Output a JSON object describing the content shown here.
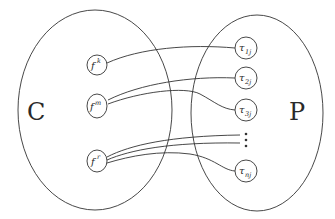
{
  "diagram": {
    "sets": {
      "left": {
        "label": "C"
      },
      "right": {
        "label": "P"
      }
    },
    "left_nodes": [
      {
        "id": "fk",
        "base": "f",
        "sup": "k"
      },
      {
        "id": "fm",
        "base": "f",
        "sup": "m"
      },
      {
        "id": "fr",
        "base": "f",
        "sup": "r"
      }
    ],
    "right_nodes": [
      {
        "id": "t1j",
        "base": "τ",
        "sub": "1j"
      },
      {
        "id": "t2j",
        "base": "τ",
        "sub": "2j"
      },
      {
        "id": "t3j",
        "base": "τ",
        "sub": "3j"
      },
      {
        "id": "tnj",
        "base": "τ",
        "sub": "nj"
      }
    ],
    "ellipsis": "⋮",
    "edges": [
      {
        "from": "fk",
        "to": "t1j"
      },
      {
        "from": "fm",
        "to": "t2j"
      },
      {
        "from": "fm",
        "to": "t3j"
      },
      {
        "from": "fr",
        "to": "ellipsis"
      },
      {
        "from": "fr",
        "to": "ellipsis"
      },
      {
        "from": "fr",
        "to": "tnj"
      }
    ],
    "colors": {
      "stroke": "#333333",
      "background": "#ffffff"
    }
  }
}
